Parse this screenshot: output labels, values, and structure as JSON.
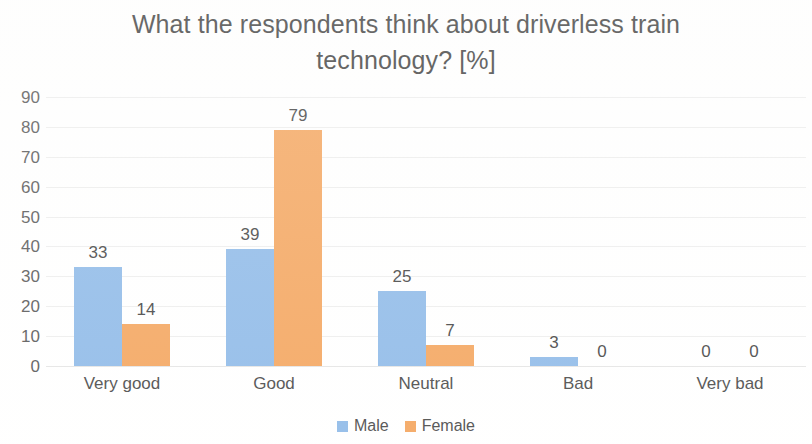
{
  "chart_data": {
    "type": "bar",
    "title": "What the respondents think about driverless train technology? [%]",
    "title_line1": "What the respondents think about driverless train",
    "title_line2": "technology? [%]",
    "xlabel": "",
    "ylabel": "",
    "ylim": [
      0,
      90
    ],
    "ytick_step": 10,
    "yticks": [
      90,
      80,
      70,
      60,
      50,
      40,
      30,
      20,
      10,
      0
    ],
    "grid": true,
    "grid_axis": "y",
    "legend_position": "bottom-center",
    "categories": [
      "Very good",
      "Good",
      "Neutral",
      "Bad",
      "Very bad"
    ],
    "series": [
      {
        "name": "Male",
        "color": "#8DB9E8",
        "values": [
          33,
          39,
          25,
          3,
          0
        ]
      },
      {
        "name": "Female",
        "color": "#F4A45C",
        "values": [
          14,
          79,
          7,
          0,
          0
        ]
      }
    ],
    "data_labels": [
      {
        "category": "Very good",
        "male": "33",
        "female": "14"
      },
      {
        "category": "Good",
        "male": "39",
        "female": "79"
      },
      {
        "category": "Neutral",
        "male": "25",
        "female": "7"
      },
      {
        "category": "Bad",
        "male": "3",
        "female": "0"
      },
      {
        "category": "Very bad",
        "male": "0",
        "female": "0"
      }
    ]
  },
  "legend": {
    "items": [
      {
        "label": "Male",
        "color": "#8DB9E8"
      },
      {
        "label": "Female",
        "color": "#F4A45C"
      }
    ]
  }
}
